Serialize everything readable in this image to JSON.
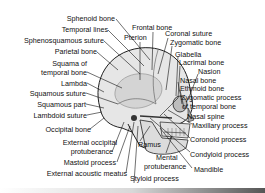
{
  "figure": {
    "labels_left": [
      {
        "text": "Sphenoid bone"
      },
      {
        "text": "Temporal lines"
      },
      {
        "text": "Sphenosquamous suture"
      },
      {
        "text": "Parietal bone"
      },
      {
        "text": "Squama of"
      },
      {
        "text": "temporal bone"
      },
      {
        "text": "Lambda"
      },
      {
        "text": "Squamous suture"
      },
      {
        "text": "Squamous part"
      },
      {
        "text": "Lambdoid suture"
      },
      {
        "text": "Occipital bone"
      },
      {
        "text": "External occipital"
      },
      {
        "text": "protuberance"
      },
      {
        "text": "Mastoid process"
      },
      {
        "text": "External acoustic meatus"
      }
    ],
    "labels_top": [
      {
        "text": "Frontal bone"
      },
      {
        "text": "Pterion"
      }
    ],
    "labels_right": [
      {
        "text": "Coronal suture"
      },
      {
        "text": "Zygomatic bone"
      },
      {
        "text": "Glabella"
      },
      {
        "text": "Lacrimal bone"
      },
      {
        "text": "Nasion"
      },
      {
        "text": "Nasal bone"
      },
      {
        "text": "Ethmoid bone"
      },
      {
        "text": "Zygomatic process"
      },
      {
        "text": "of temporal bone"
      },
      {
        "text": "Nasal spine"
      },
      {
        "text": "Maxillary process"
      },
      {
        "text": "Coronoid process"
      },
      {
        "text": "Condyloid process"
      },
      {
        "text": "Mandible"
      }
    ],
    "labels_bottom": [
      {
        "text": "Ramus"
      },
      {
        "text": "Mental"
      },
      {
        "text": "protuberance"
      },
      {
        "text": "Styloid process"
      }
    ]
  }
}
